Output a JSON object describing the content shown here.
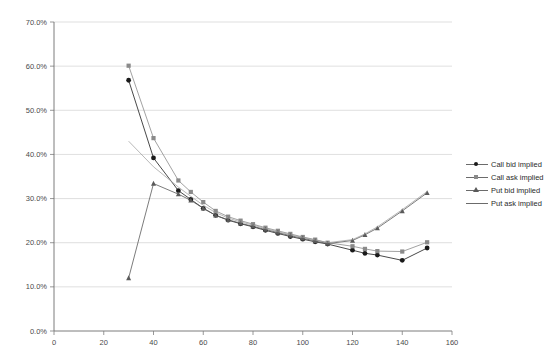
{
  "chart_data": {
    "type": "line",
    "title": "",
    "xlabel": "",
    "ylabel": "",
    "xlim": [
      0,
      160
    ],
    "ylim": [
      0,
      0.7
    ],
    "xticks": [
      0,
      20,
      40,
      60,
      80,
      100,
      120,
      140,
      160
    ],
    "xtick_labels": [
      "0",
      "20",
      "40",
      "60",
      "80",
      "100",
      "120",
      "140",
      "160"
    ],
    "yticks": [
      0,
      0.1,
      0.2,
      0.3,
      0.4,
      0.5,
      0.6,
      0.7
    ],
    "ytick_labels": [
      "0.0%",
      "10.0%",
      "20.0%",
      "30.0%",
      "40.0%",
      "50.0%",
      "60.0%",
      "70.0%"
    ],
    "grid": "horizontal",
    "legend_position": "right",
    "series": [
      {
        "name": "Call bid implied",
        "marker": "circle",
        "color": "#1a1a1a",
        "x": [
          30,
          40,
          50,
          55,
          60,
          65,
          70,
          75,
          80,
          85,
          90,
          95,
          100,
          105,
          110,
          120,
          125,
          130,
          140,
          150
        ],
        "y": [
          0.568,
          0.392,
          0.318,
          0.298,
          0.278,
          0.262,
          0.251,
          0.243,
          0.236,
          0.228,
          0.221,
          0.214,
          0.208,
          0.202,
          0.197,
          0.183,
          0.176,
          0.172,
          0.16,
          0.188
        ]
      },
      {
        "name": "Call ask implied",
        "marker": "square",
        "color": "#8a8a8a",
        "x": [
          30,
          40,
          50,
          55,
          60,
          65,
          70,
          75,
          80,
          85,
          90,
          95,
          100,
          105,
          110,
          120,
          125,
          130,
          140,
          150
        ],
        "y": [
          0.601,
          0.437,
          0.341,
          0.315,
          0.292,
          0.272,
          0.259,
          0.25,
          0.242,
          0.234,
          0.227,
          0.22,
          0.213,
          0.207,
          0.2,
          0.192,
          0.186,
          0.181,
          0.18,
          0.201
        ]
      },
      {
        "name": "Put bid implied",
        "marker": "triangle",
        "color": "#5a5a5a",
        "x": [
          30,
          40,
          50,
          55,
          60,
          65,
          70,
          75,
          80,
          85,
          90,
          95,
          100,
          105,
          110,
          120,
          125,
          130,
          140,
          150
        ],
        "y": [
          0.12,
          0.334,
          0.31,
          0.296,
          0.278,
          0.262,
          0.252,
          0.244,
          0.237,
          0.23,
          0.223,
          0.216,
          0.21,
          0.204,
          0.198,
          0.205,
          0.218,
          0.233,
          0.272,
          0.313
        ]
      },
      {
        "name": "Put ask implied",
        "marker": "none",
        "color": "#9a9a9a",
        "x": [
          30,
          40,
          50,
          55,
          60,
          65,
          70,
          75,
          80,
          85,
          90,
          95,
          100,
          105,
          110,
          120,
          125,
          130,
          140,
          150
        ],
        "y": [
          0.43,
          0.372,
          0.326,
          0.305,
          0.285,
          0.268,
          0.256,
          0.247,
          0.24,
          0.232,
          0.225,
          0.218,
          0.212,
          0.206,
          0.2,
          0.207,
          0.22,
          0.236,
          0.275,
          0.316
        ]
      }
    ]
  },
  "legend": {
    "items": [
      {
        "label": "Call bid implied",
        "marker": "circle"
      },
      {
        "label": "Call ask implied",
        "marker": "square"
      },
      {
        "label": "Put bid implied",
        "marker": "triangle"
      },
      {
        "label": "Put ask implied",
        "marker": "none"
      }
    ]
  }
}
